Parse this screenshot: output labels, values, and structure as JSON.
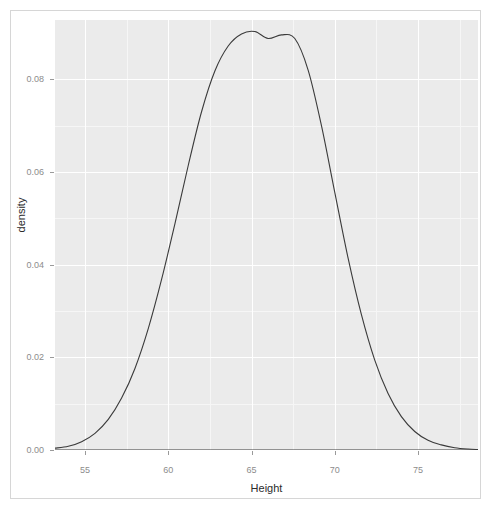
{
  "chart_data": {
    "type": "line",
    "plot_style": "density-curve",
    "title": "",
    "xlabel": "Height",
    "ylabel": "density",
    "xlim": [
      53.2,
      78.6
    ],
    "ylim": [
      0.0,
      0.0928
    ],
    "grid": true,
    "legend": null,
    "x_ticks": [
      55,
      60,
      65,
      70,
      75
    ],
    "x_tick_labels": [
      "55",
      "60",
      "65",
      "70",
      "75"
    ],
    "y_ticks": [
      0.0,
      0.02,
      0.04,
      0.06,
      0.08
    ],
    "y_tick_labels": [
      "0.00",
      "0.02",
      "0.04",
      "0.06",
      "0.08"
    ],
    "x_minor_ticks": [
      57.5,
      62.5,
      67.5,
      72.5,
      77.5
    ],
    "y_minor_ticks": [
      0.01,
      0.03,
      0.05,
      0.07
    ],
    "series": [
      {
        "name": "density",
        "x": [
          53.2,
          54.0,
          54.8,
          55.6,
          56.4,
          57.2,
          58.0,
          58.8,
          59.6,
          60.4,
          61.2,
          62.0,
          62.8,
          63.6,
          64.4,
          65.2,
          66.0,
          66.8,
          67.6,
          68.4,
          69.2,
          70.0,
          70.8,
          71.6,
          72.4,
          73.2,
          74.0,
          74.8,
          75.6,
          76.4,
          77.2,
          78.0,
          78.6
        ],
        "y": [
          0.0004,
          0.0008,
          0.0018,
          0.0036,
          0.0066,
          0.0112,
          0.0176,
          0.0262,
          0.0368,
          0.0488,
          0.0614,
          0.073,
          0.0818,
          0.0872,
          0.0898,
          0.0903,
          0.0888,
          0.0896,
          0.0888,
          0.082,
          0.07,
          0.0556,
          0.0414,
          0.0292,
          0.0194,
          0.0122,
          0.0072,
          0.004,
          0.0021,
          0.0011,
          0.0005,
          0.0002,
          0.0001
        ],
        "color": "#3a3a3a",
        "linewidth": 1.1
      },
      {
        "name": "baseline",
        "x": [
          53.2,
          78.6
        ],
        "y": [
          0.0,
          0.0
        ],
        "color": "#3a3a3a",
        "linewidth": 1.1
      }
    ],
    "peak": {
      "x": 65.2,
      "y": 0.0903,
      "note": "plateau with slight dip near 66"
    },
    "colors": {
      "panel_background": "#ebebeb",
      "major_gridline": "#ffffff",
      "minor_gridline": "#f6f6f6",
      "curve": "#3a3a3a",
      "tick_label": "#8c8c8c",
      "axis_title": "#2b2b2b",
      "figure_background": "#ffffff",
      "device_border": "#d6d6d6"
    }
  },
  "axes": {
    "y_title": "density",
    "x_title": "Height"
  }
}
